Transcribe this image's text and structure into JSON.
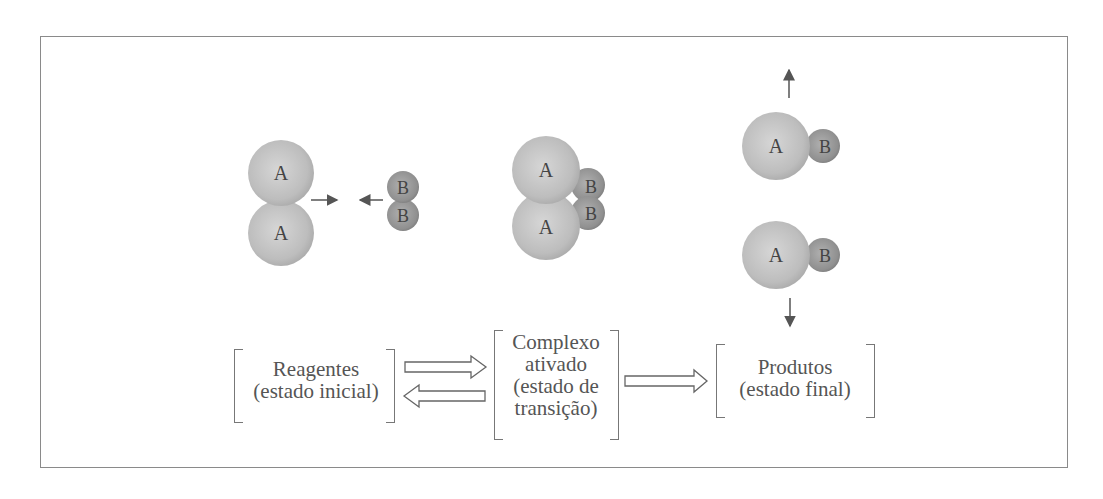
{
  "diagram": {
    "colors": {
      "atom_a": "#c4c4c4",
      "atom_b": "#9a9a9a",
      "frame": "#8a8a8a",
      "text": "#555555"
    },
    "stages": [
      {
        "id": "reagentes",
        "line1": "Reagentes",
        "line2": "(estado inicial)"
      },
      {
        "id": "complexo",
        "line1": "Complexo",
        "line2": "ativado",
        "line3": "(estado de",
        "line4": "transição)"
      },
      {
        "id": "produtos",
        "line1": "Produtos",
        "line2": "(estado final)"
      }
    ],
    "atoms": {
      "a": "A",
      "b": "B"
    },
    "arrows": [
      {
        "from": "reagentes",
        "to": "complexo",
        "type": "forward"
      },
      {
        "from": "complexo",
        "to": "reagentes",
        "type": "reverse"
      },
      {
        "from": "complexo",
        "to": "produtos",
        "type": "forward"
      }
    ]
  }
}
